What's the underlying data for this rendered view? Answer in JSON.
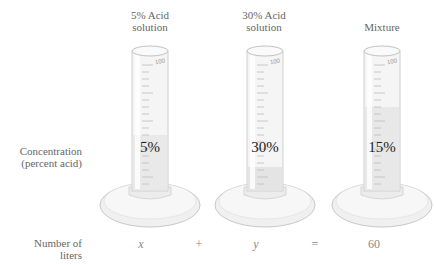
{
  "columns": [
    {
      "title_line1": "5% Acid",
      "title_line2": "solution",
      "concentration": "5%",
      "liters": "x",
      "scale_max": "100"
    },
    {
      "title_line1": "30% Acid",
      "title_line2": "solution",
      "concentration": "30%",
      "liters": "y",
      "scale_max": "100"
    },
    {
      "title_line1": "",
      "title_line2": "Mixture",
      "concentration": "15%",
      "liters": "60",
      "scale_max": "100"
    }
  ],
  "row_labels": {
    "concentration_line1": "Concentration",
    "concentration_line2": "(percent acid)",
    "liters_line1": "Number of",
    "liters_line2": "liters"
  },
  "operators": {
    "plus": "+",
    "equals": "="
  },
  "colors": {
    "glass": "#f3f3f3",
    "glass_edge": "#c9c9c9",
    "liquid": "#e6e6e6",
    "text_dark": "#222222",
    "text_light": "#777777"
  }
}
